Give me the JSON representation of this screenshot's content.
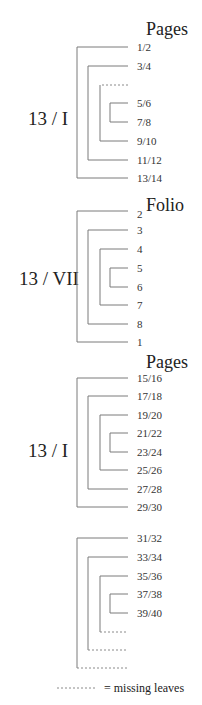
{
  "diagram": {
    "type": "collation",
    "sections": [
      {
        "header": "Pages",
        "quire_label": "13 / I",
        "leaves": [
          "1/2",
          "3/4",
          "",
          "5/6",
          "7/8",
          "9/10",
          "11/12",
          "13/14"
        ],
        "missing_leaf_indices": [
          2
        ]
      },
      {
        "header": "Folio",
        "quire_label": "13 / VII",
        "leaves": [
          "2",
          "3",
          "4",
          "5",
          "6",
          "7",
          "8",
          "1"
        ]
      },
      {
        "header": "Pages",
        "quire_label": "13 / I",
        "leaves": [
          "15/16",
          "17/18",
          "19/20",
          "21/22",
          "23/24",
          "25/26",
          "27/28",
          "29/30"
        ]
      },
      {
        "header": "",
        "quire_label": "",
        "leaves": [
          "31/32",
          "33/34",
          "35/36",
          "37/38",
          "39/40",
          "",
          "",
          ""
        ],
        "missing_leaf_indices": [
          5,
          6,
          7
        ]
      }
    ],
    "legend": {
      "text": "= missing leaves"
    }
  }
}
